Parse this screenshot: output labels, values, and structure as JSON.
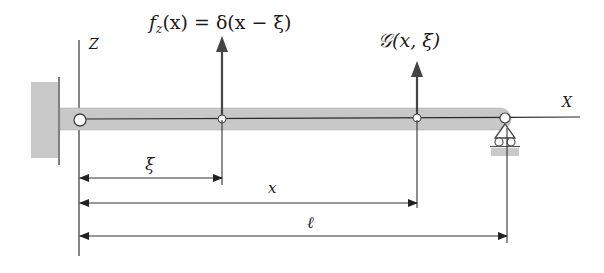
{
  "labels": {
    "z_axis": "Z",
    "x_axis": "X",
    "load": "f",
    "load_sub": "z",
    "load_rest": "(x) = δ(x − ξ)",
    "greens": "𝒢(x, ξ)",
    "dim_xi": "ξ",
    "dim_x": "x",
    "dim_l": "ℓ"
  },
  "colors": {
    "beam_fill": "#c8c8c8",
    "beam_line": "#2a2a2a",
    "support_fill": "#c9c9c9",
    "line": "#333333",
    "arrow": "#444444"
  }
}
